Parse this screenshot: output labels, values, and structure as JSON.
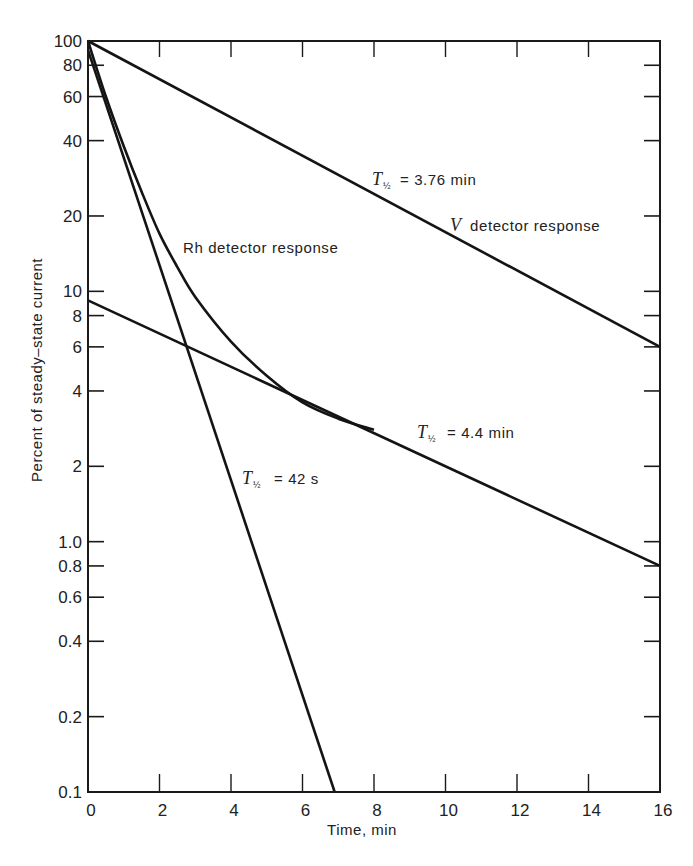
{
  "chart_data": {
    "type": "line",
    "title": "",
    "xlabel": "Time, min",
    "ylabel": "Percent of steady–state current",
    "xscale": "linear",
    "yscale": "log",
    "xlim": [
      0,
      16
    ],
    "ylim": [
      0.1,
      100
    ],
    "grid": false,
    "legend": null,
    "x_ticks": [
      0,
      2,
      4,
      6,
      8,
      10,
      12,
      14,
      16
    ],
    "x_tick_labels": [
      "0",
      "2",
      "4",
      "6",
      "8",
      "10",
      "12",
      "14",
      "16"
    ],
    "y_ticks": [
      100,
      80,
      60,
      40,
      20,
      10,
      8,
      6,
      4,
      2,
      1.0,
      0.8,
      0.6,
      0.4,
      0.2,
      0.1
    ],
    "y_tick_labels": [
      "100",
      "80",
      "60",
      "40",
      "20",
      "10",
      "8",
      "6",
      "4",
      "2",
      "1.0",
      "0.8",
      "0.6",
      "0.4",
      "0.2",
      "0.1"
    ],
    "series": [
      {
        "name": "V detector response",
        "kind": "straight",
        "half_life": "3.76 min",
        "x": [
          0,
          16
        ],
        "y": [
          100,
          6.0
        ]
      },
      {
        "name": "Rh detector response",
        "kind": "curve",
        "x": [
          0,
          0.5,
          1,
          1.5,
          2,
          2.5,
          3,
          4,
          5,
          6,
          7,
          8
        ],
        "y": [
          100,
          60,
          38,
          25,
          17,
          12.5,
          9.5,
          6.3,
          4.6,
          3.6,
          3.1,
          2.8
        ]
      },
      {
        "name": "Fast component",
        "kind": "straight",
        "half_life": "42 s",
        "x": [
          0,
          6.9
        ],
        "y": [
          92,
          0.1
        ]
      },
      {
        "name": "Slow component",
        "kind": "straight",
        "half_life": "4.4 min",
        "x": [
          0,
          16
        ],
        "y": [
          9.2,
          0.8
        ]
      }
    ],
    "annotations": [
      {
        "text": "T½ = 3.76 min",
        "x": 8.2,
        "y": 28
      },
      {
        "text": "V detector response",
        "x": 10.0,
        "y": 19
      },
      {
        "text": "Rh detector response",
        "x": 2.6,
        "y": 17.5
      },
      {
        "text": "T½ = 4.4 min",
        "x": 9.1,
        "y": 2.9
      },
      {
        "text": "T½ = 42 s",
        "x": 3.5,
        "y": 1.7
      }
    ]
  },
  "labels": {
    "xlabel": "Time, min",
    "ylabel": "Percent of steady–state current",
    "a1_main": "T",
    "a1_sub": "½",
    "a1_rest": "= 3.76 min",
    "v_italic": "V",
    "v_rest": "detector response",
    "rh": "Rh detector response",
    "a2_main": "T",
    "a2_sub": "½",
    "a2_rest": "= 4.4 min",
    "a3_main": "T",
    "a3_sub": "½",
    "a3_rest": "= 42 s"
  }
}
